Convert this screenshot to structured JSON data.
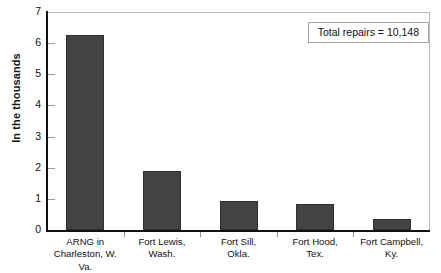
{
  "chart_data": {
    "type": "bar",
    "title": "",
    "subtitle": "",
    "xlabel": "",
    "ylabel": "In the thousands",
    "ylim": [
      0,
      7
    ],
    "ytick_values": [
      0,
      1,
      2,
      3,
      4,
      5,
      6,
      7
    ],
    "ytick_labels": [
      "0",
      "1",
      "2",
      "3",
      "4",
      "5",
      "6",
      "7"
    ],
    "grid": false,
    "legend": "none",
    "categories": [
      "ARNG in\nCharleston, W. Va.",
      "Fort Lewis,\nWash.",
      "Fort Sill,\nOkla.",
      "Fort Hood,\nTex.",
      "Fort Campbell,\nKy."
    ],
    "category_lines": [
      [
        "ARNG in",
        "Charleston, W. Va."
      ],
      [
        "Fort Lewis,",
        "Wash."
      ],
      [
        "Fort Sill,",
        "Okla."
      ],
      [
        "Fort Hood,",
        "Tex."
      ],
      [
        "Fort Campbell,",
        "Ky."
      ]
    ],
    "values": [
      6.25,
      1.9,
      0.92,
      0.82,
      0.35
    ],
    "value_units": "thousands of repairs",
    "annotations": [
      {
        "text": "Total repairs = 10,148",
        "position": "top-right"
      }
    ],
    "colors": {
      "bar_fill": "#434343",
      "bar_edge": "#2e2e2e",
      "axis": "#111111",
      "frame": "#b9b9b9",
      "tick": "#9a9a9a",
      "text": "#111111",
      "background": "#ffffff"
    }
  },
  "annotation_box": {
    "label": "Total repairs = 10,148"
  },
  "axes": {
    "y_title": "In the thousands"
  }
}
